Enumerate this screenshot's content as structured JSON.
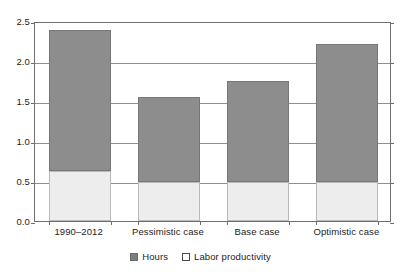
{
  "chart_data": {
    "type": "bar",
    "subtype": "stacked",
    "title": "",
    "xlabel": "",
    "ylabel": "",
    "ylim": [
      0.0,
      2.5
    ],
    "yticks": [
      "0.0",
      "0.5",
      "1.0",
      "1.5",
      "2.0",
      "2.5"
    ],
    "ytick_values": [
      0.0,
      0.5,
      1.0,
      1.5,
      2.0,
      2.5
    ],
    "grid": true,
    "legend_position": "bottom-center",
    "categories": [
      "1990–2012",
      "Pessimistic case",
      "Base case",
      "Optimistic case"
    ],
    "series": [
      {
        "name": "Labor productivity",
        "color": "#ededed",
        "values": [
          0.62,
          0.49,
          0.49,
          0.49
        ]
      },
      {
        "name": "Hours",
        "color": "#8d8d8d",
        "values": [
          1.77,
          1.06,
          1.26,
          1.72
        ]
      }
    ],
    "totals": [
      2.39,
      1.55,
      1.75,
      2.21
    ]
  },
  "legend": {
    "items": [
      {
        "label": "Hours",
        "swatch": "dark-gray-square-icon"
      },
      {
        "label": "Labor productivity",
        "swatch": "white-square-icon"
      }
    ]
  }
}
